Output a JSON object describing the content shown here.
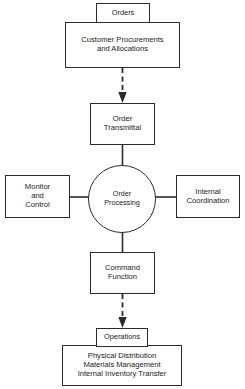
{
  "diagram": {
    "colors": {
      "stroke": "#2b2b2b",
      "text": "#1a1a1a",
      "background": "#ffffff"
    },
    "nodes": {
      "orders": {
        "label": "Orders"
      },
      "customer_procurements": {
        "line1": "Customer Procurements",
        "line2": "and Allocations"
      },
      "order_transmittal": {
        "line1": "Order",
        "line2": "Transmittal"
      },
      "monitor_and_control": {
        "line1": "Monitor",
        "line2": "and",
        "line3": "Control"
      },
      "order_processing": {
        "line1": "Order",
        "line2": "Processing"
      },
      "internal_coordination": {
        "line1": "Internal",
        "line2": "Coordination"
      },
      "command_function": {
        "line1": "Command",
        "line2": "Function"
      },
      "operations": {
        "label": "Operations"
      },
      "operations_detail": {
        "line1": "Physical Distribution",
        "line2": "Materials Management",
        "line3": "Internal Inventory Transfer"
      }
    },
    "connectors": [
      {
        "name": "customer-to-transmittal",
        "style": "dashed",
        "arrow": "down"
      },
      {
        "name": "transmittal-to-processing",
        "style": "solid",
        "arrow": "none"
      },
      {
        "name": "monitor-to-processing",
        "style": "solid",
        "arrow": "none"
      },
      {
        "name": "processing-to-internal",
        "style": "solid",
        "arrow": "none"
      },
      {
        "name": "processing-to-command",
        "style": "solid",
        "arrow": "none"
      },
      {
        "name": "command-to-operations",
        "style": "dashed",
        "arrow": "down"
      }
    ]
  }
}
